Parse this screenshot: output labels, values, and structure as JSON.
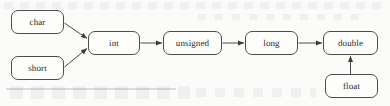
{
  "diagram": {
    "type": "flowchart",
    "colors": {
      "node_border": "#4d4d4d",
      "node_fill": "#fdfdfc",
      "edge": "#4d4d4d",
      "text": "#2b2b2b",
      "background": "#fbfbfa"
    },
    "nodes": [
      {
        "id": "char",
        "label": "char",
        "x": 11,
        "y": 10,
        "w": 53,
        "h": 24
      },
      {
        "id": "short",
        "label": "short",
        "x": 11,
        "y": 56,
        "w": 53,
        "h": 24
      },
      {
        "id": "int",
        "label": "int",
        "x": 88,
        "y": 31,
        "w": 52,
        "h": 24
      },
      {
        "id": "unsigned",
        "label": "unsigned",
        "x": 163,
        "y": 31,
        "w": 59,
        "h": 24
      },
      {
        "id": "long",
        "label": "long",
        "x": 245,
        "y": 31,
        "w": 53,
        "h": 24
      },
      {
        "id": "double",
        "label": "double",
        "x": 323,
        "y": 31,
        "w": 55,
        "h": 24
      },
      {
        "id": "float",
        "label": "float",
        "x": 325,
        "y": 74,
        "w": 53,
        "h": 24
      }
    ],
    "edges": [
      {
        "id": "char-to-int",
        "from": "char",
        "to": "int",
        "style": "diagonal-down-right",
        "arrowhead": "solid-triangle"
      },
      {
        "id": "short-to-int",
        "from": "short",
        "to": "int",
        "style": "diagonal-up-right",
        "arrowhead": "solid-triangle"
      },
      {
        "id": "int-to-unsigned",
        "from": "int",
        "to": "unsigned",
        "style": "horizontal",
        "arrowhead": "solid-triangle"
      },
      {
        "id": "unsigned-to-long",
        "from": "unsigned",
        "to": "long",
        "style": "horizontal",
        "arrowhead": "solid-triangle"
      },
      {
        "id": "long-to-double",
        "from": "long",
        "to": "double",
        "style": "horizontal",
        "arrowhead": "solid-triangle"
      },
      {
        "id": "float-to-double",
        "from": "float",
        "to": "double",
        "style": "vertical-up",
        "arrowhead": "solid-triangle"
      }
    ]
  }
}
